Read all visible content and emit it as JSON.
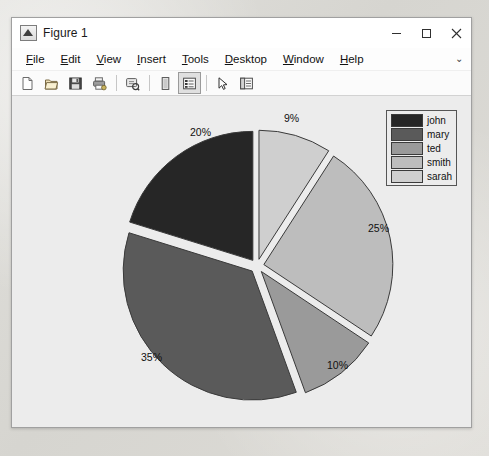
{
  "window": {
    "title": "Figure 1",
    "icon": "matlab-figure-icon",
    "controls": [
      {
        "name": "minimize-button",
        "glyph": "minimize"
      },
      {
        "name": "maximize-button",
        "glyph": "maximize"
      },
      {
        "name": "close-button",
        "glyph": "close"
      }
    ]
  },
  "menubar": {
    "items": [
      {
        "label": "File",
        "mnemonic": "F"
      },
      {
        "label": "Edit",
        "mnemonic": "E"
      },
      {
        "label": "View",
        "mnemonic": "V"
      },
      {
        "label": "Insert",
        "mnemonic": "I"
      },
      {
        "label": "Tools",
        "mnemonic": "T"
      },
      {
        "label": "Desktop",
        "mnemonic": "D"
      },
      {
        "label": "Window",
        "mnemonic": "W"
      },
      {
        "label": "Help",
        "mnemonic": "H"
      }
    ],
    "overflow_glyph": "⌄"
  },
  "toolbar": {
    "buttons": [
      {
        "name": "new-figure-icon",
        "label": "New Figure"
      },
      {
        "name": "open-file-icon",
        "label": "Open File"
      },
      {
        "name": "save-figure-icon",
        "label": "Save Figure"
      },
      {
        "name": "print-figure-icon",
        "label": "Print Figure"
      },
      {
        "name": "zoom-link-icon",
        "label": "Link Plot"
      },
      {
        "name": "insert-colorbar-icon",
        "label": "Insert Colorbar"
      },
      {
        "name": "insert-legend-icon",
        "label": "Insert Legend"
      },
      {
        "name": "edit-plot-pointer-icon",
        "label": "Edit Plot"
      },
      {
        "name": "show-plot-tools-icon",
        "label": "Show Plot Tools"
      }
    ]
  },
  "chart_data": {
    "type": "pie",
    "title": "",
    "exploded": true,
    "start_angle_deg": 90,
    "direction": "clockwise",
    "categories": [
      "sarah",
      "smith",
      "ted",
      "mary",
      "john"
    ],
    "values": [
      9,
      25,
      10,
      35,
      20
    ],
    "labels": [
      "9%",
      "25%",
      "10%",
      "35%",
      "20%"
    ],
    "colors": [
      "#cfcfcf",
      "#bdbdbd",
      "#9a9a9a",
      "#5a5a5a",
      "#262626"
    ],
    "edge_color": "#3a3a3a",
    "background": "#ececec",
    "legend": {
      "position": "upper-right",
      "entries": [
        {
          "label": "john",
          "color": "#262626"
        },
        {
          "label": "mary",
          "color": "#5a5a5a"
        },
        {
          "label": "ted",
          "color": "#9a9a9a"
        },
        {
          "label": "smith",
          "color": "#bdbdbd"
        },
        {
          "label": "sarah",
          "color": "#cfcfcf"
        }
      ]
    }
  }
}
